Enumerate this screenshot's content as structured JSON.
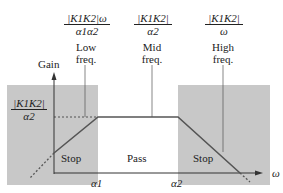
{
  "diagram": {
    "y_axis_label": "Gain",
    "x_axis_label": "ω",
    "x_ticks": [
      "α1",
      "α2"
    ],
    "y_level_label": {
      "numerator": "|K1K2|",
      "denominator": "α2"
    },
    "regions": [
      {
        "name": "Stop",
        "shaded": true
      },
      {
        "name": "Pass",
        "shaded": false
      },
      {
        "name": "Stop",
        "shaded": true
      }
    ],
    "annotations": [
      {
        "formula_numerator": "|K1K2|ω",
        "formula_denominator": "α1α2",
        "line1": "Low",
        "line2": "freq."
      },
      {
        "formula_numerator": "|K1K2|",
        "formula_denominator": "α2",
        "line1": "Mid",
        "line2": "freq."
      },
      {
        "formula_numerator": "|K1K2|",
        "formula_denominator": "ω",
        "line1": "High",
        "line2": "freq."
      }
    ],
    "colors": {
      "shade": "#c8c8c8",
      "line": "#555555",
      "axis": "#333333"
    }
  }
}
